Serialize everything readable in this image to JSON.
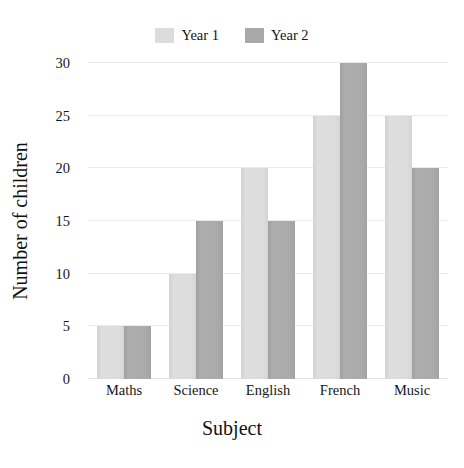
{
  "chart_data": {
    "type": "bar",
    "title": "",
    "subtitle": "",
    "xlabel": "Subject",
    "ylabel": "Number of children",
    "categories": [
      "Maths",
      "Science",
      "English",
      "French",
      "Music"
    ],
    "series": [
      {
        "name": "Year 1",
        "color": "#dcdcdc",
        "values": [
          5,
          10,
          20,
          25,
          25
        ]
      },
      {
        "name": "Year 2",
        "color": "#a8a8a8",
        "values": [
          5,
          15,
          15,
          30,
          20
        ]
      }
    ],
    "ylim": [
      0,
      30
    ],
    "ytick_values": [
      0,
      5,
      10,
      15,
      20,
      25,
      30
    ],
    "ytick_labels": [
      "0",
      "5",
      "10",
      "15",
      "20",
      "25",
      "30"
    ],
    "grid": "horizontal",
    "grid_color": "#eceaea",
    "legend_position": "top-center",
    "orientation": "vertical",
    "grouping": "clustered",
    "background_color": "#ffffff"
  },
  "legend": {
    "entries": [
      {
        "label": "Year 1",
        "color": "#dcdcdc"
      },
      {
        "label": "Year 2",
        "color": "#a8a8a8"
      }
    ]
  },
  "axes": {
    "x_title": "Subject",
    "y_title": "Number of children"
  }
}
